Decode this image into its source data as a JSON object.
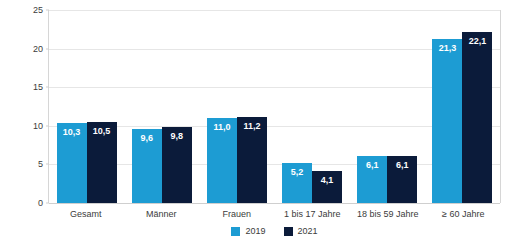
{
  "chart_data": {
    "type": "bar",
    "title": "",
    "xlabel": "",
    "ylabel": "Anzahl Arzneiverordnungen je Einwohner",
    "ylim": [
      0,
      25
    ],
    "yticks": [
      "0",
      "5",
      "10",
      "15",
      "20",
      "25"
    ],
    "ytick_values": [
      0,
      5,
      10,
      15,
      20,
      25
    ],
    "grid": true,
    "legend_position": "bottom-center",
    "categories": [
      "Gesamt",
      "Männer",
      "Frauen",
      "1 bis 17 Jahre",
      "18 bis 59 Jahre",
      "≥ 60 Jahre"
    ],
    "series": [
      {
        "name": "2019",
        "color": "#1d9cd3",
        "values": [
          10.3,
          9.6,
          11.0,
          5.2,
          6.1,
          21.3
        ],
        "labels": [
          "10,3",
          "9,6",
          "11,0",
          "5,2",
          "6,1",
          "21,3"
        ]
      },
      {
        "name": "2021",
        "color": "#0b1b3a",
        "values": [
          10.5,
          9.8,
          11.2,
          4.1,
          6.1,
          22.1
        ],
        "labels": [
          "10,5",
          "9,8",
          "11,2",
          "4,1",
          "6,1",
          "22,1"
        ]
      }
    ]
  },
  "colors": {
    "series_2019": "#1d9cd3",
    "series_2021": "#0b1b3a",
    "gridline": "#e6e6e6",
    "axis": "#cfcfcf",
    "text": "#3b3b3b",
    "background": "#ffffff"
  }
}
